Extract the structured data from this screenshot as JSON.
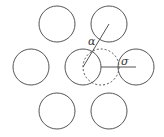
{
  "diagram": {
    "colors": {
      "stroke": "#555555",
      "background": "#ffffff"
    },
    "circles": [
      {
        "id": "top-left",
        "cx": 57,
        "cy": 24,
        "r": 18,
        "style": "solid"
      },
      {
        "id": "top-right",
        "cx": 109,
        "cy": 24,
        "r": 18,
        "style": "solid"
      },
      {
        "id": "middle-left",
        "cx": 31,
        "cy": 67,
        "r": 18,
        "style": "solid"
      },
      {
        "id": "middle-center",
        "cx": 83,
        "cy": 67,
        "r": 18,
        "style": "solid"
      },
      {
        "id": "middle-right",
        "cx": 136,
        "cy": 67,
        "r": 18,
        "style": "solid"
      },
      {
        "id": "bottom-left",
        "cx": 57,
        "cy": 111,
        "r": 18,
        "style": "solid"
      },
      {
        "id": "bottom-right",
        "cx": 109,
        "cy": 111,
        "r": 18,
        "style": "solid"
      },
      {
        "id": "displaced",
        "cx": 101,
        "cy": 67,
        "r": 18,
        "style": "dashed"
      }
    ],
    "lines": [
      {
        "id": "alpha-line",
        "x1": 83,
        "y1": 67,
        "x2": 109,
        "y2": 24
      },
      {
        "id": "sigma-line",
        "x1": 101,
        "y1": 67,
        "x2": 136,
        "y2": 67
      }
    ],
    "labels": {
      "alpha": {
        "text": "α",
        "x": 88,
        "y": 45
      },
      "sigma": {
        "text": "σ",
        "x": 121,
        "y": 65
      }
    }
  }
}
